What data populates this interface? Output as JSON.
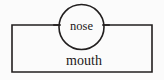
{
  "diagram": {
    "type": "labeled-line-diagram",
    "background_color": "#fbfbfb",
    "stroke_color": "#221f1f",
    "nodes": [
      {
        "id": "mouth",
        "shape": "rectangle",
        "label": "mouth",
        "x": 12,
        "y": 25,
        "width": 140,
        "height": 47,
        "label_x": 84,
        "label_y": 62
      },
      {
        "id": "nose",
        "shape": "circle",
        "label": "nose",
        "center_x": 81.5,
        "center_y": 27,
        "radius": 22.5,
        "label_x": 81.5,
        "label_y": 26
      }
    ]
  }
}
